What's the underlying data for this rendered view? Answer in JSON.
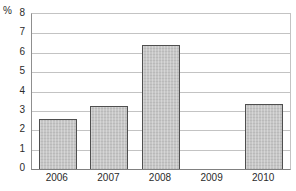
{
  "chart": {
    "unit_label": "%"
  },
  "chart_data": {
    "type": "bar",
    "title": "",
    "xlabel": "",
    "ylabel": "%",
    "categories": [
      "2006",
      "2007",
      "2008",
      "2009",
      "2010"
    ],
    "values": [
      2.6,
      3.25,
      6.4,
      0,
      3.35
    ],
    "ylim": [
      0,
      8
    ],
    "yticks": [
      0,
      1,
      2,
      3,
      4,
      5,
      6,
      7,
      8
    ],
    "grid": "horizontal",
    "legend": "none",
    "colors": {
      "background": "#ffffff",
      "bar_fill": "#c6c6c6",
      "bar_border": "#4f4f4f",
      "gridline": "#c3c3c3",
      "axis_left": "#8f8f8f",
      "axis_bottom": "#808080",
      "text": "#2b2b2b"
    }
  }
}
